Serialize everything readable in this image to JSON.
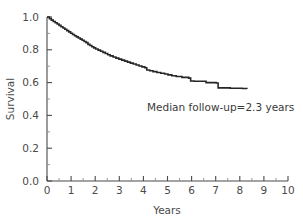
{
  "chart_data": {
    "type": "line",
    "title": "",
    "subtitle": "",
    "xlabel": "Years",
    "ylabel": "Survival",
    "xlim": [
      0,
      10
    ],
    "ylim": [
      0.0,
      1.0
    ],
    "grid": false,
    "legend": null,
    "x_ticks": [
      0,
      1,
      2,
      3,
      4,
      5,
      6,
      7,
      8,
      9,
      10
    ],
    "x_tick_labels": [
      "0",
      "1",
      "2",
      "3",
      "4",
      "5",
      "6",
      "7",
      "8",
      "9",
      "10"
    ],
    "x_minor_ticks": [
      0.5,
      1.5,
      2.5,
      3.5,
      4.5,
      5.5,
      6.5,
      7.5,
      8.5,
      9.5
    ],
    "y_ticks": [
      0.0,
      0.2,
      0.4,
      0.6,
      0.8,
      1.0
    ],
    "y_tick_labels": [
      "0.0",
      "0.2",
      "0.4",
      "0.6",
      "0.8",
      "1.0"
    ],
    "y_minor_ticks": [
      0.1,
      0.3,
      0.5,
      0.7,
      0.9
    ],
    "curve_style": "step",
    "curve_color": "#262626",
    "annotations": [
      {
        "text": "Median follow-up=2.3 years",
        "x": 4.15,
        "y": 0.43
      }
    ],
    "series": [
      {
        "name": "Survival",
        "x": [
          0.0,
          0.1,
          0.18,
          0.26,
          0.34,
          0.42,
          0.5,
          0.58,
          0.66,
          0.74,
          0.82,
          0.9,
          0.98,
          1.06,
          1.14,
          1.22,
          1.3,
          1.38,
          1.46,
          1.54,
          1.62,
          1.7,
          1.78,
          1.86,
          1.94,
          2.02,
          2.12,
          2.22,
          2.32,
          2.42,
          2.52,
          2.62,
          2.74,
          2.86,
          2.98,
          3.1,
          3.22,
          3.34,
          3.46,
          3.58,
          3.7,
          3.82,
          3.94,
          4.06,
          4.14,
          4.26,
          4.4,
          4.56,
          4.72,
          4.88,
          5.02,
          5.18,
          5.36,
          5.6,
          5.88,
          5.96,
          6.1,
          6.6,
          7.02,
          7.1,
          7.6,
          8.1,
          8.3
        ],
        "y": [
          1.0,
          0.99,
          0.981,
          0.973,
          0.965,
          0.957,
          0.949,
          0.941,
          0.933,
          0.925,
          0.917,
          0.909,
          0.901,
          0.893,
          0.886,
          0.879,
          0.872,
          0.865,
          0.858,
          0.851,
          0.844,
          0.833,
          0.826,
          0.819,
          0.812,
          0.805,
          0.798,
          0.791,
          0.784,
          0.777,
          0.77,
          0.763,
          0.756,
          0.749,
          0.743,
          0.737,
          0.731,
          0.725,
          0.719,
          0.713,
          0.707,
          0.701,
          0.696,
          0.691,
          0.677,
          0.672,
          0.667,
          0.662,
          0.657,
          0.652,
          0.647,
          0.642,
          0.637,
          0.632,
          0.627,
          0.61,
          0.608,
          0.6,
          0.598,
          0.568,
          0.566,
          0.564,
          0.562
        ]
      }
    ]
  },
  "figure": {
    "background_color": "#ffffff",
    "axis_color": "#4a4a4a",
    "text_color": "#3a3a3a"
  }
}
